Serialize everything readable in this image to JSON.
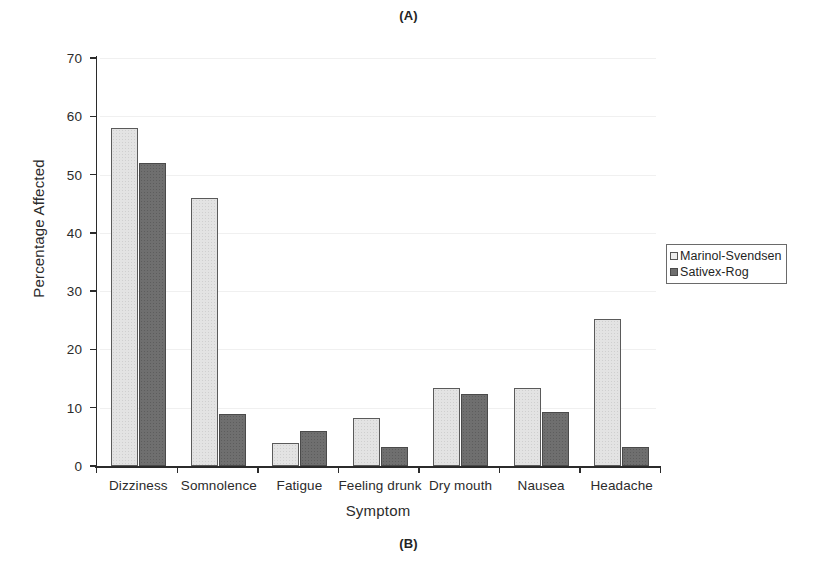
{
  "panels": {
    "top_label": "(A)",
    "bottom_label": "(B)"
  },
  "legend": {
    "position": "right",
    "entries": [
      {
        "label": "Marinol-Svendsen",
        "swatch": "light-gray-square-icon",
        "color": "#ededed"
      },
      {
        "label": "Sativex-Rog",
        "swatch": "dark-gray-square-icon",
        "color": "#6f6f6f"
      }
    ]
  },
  "chart_data": {
    "type": "bar",
    "title": "",
    "subtitle": "",
    "xlabel": "Symptom",
    "ylabel": "Percentage Affected",
    "ylim": [
      0,
      70
    ],
    "ytick_interval": 10,
    "yticks": [
      0,
      10,
      20,
      30,
      40,
      50,
      60,
      70
    ],
    "ytick_labels": [
      "0",
      "10",
      "20",
      "30",
      "40",
      "50",
      "60",
      "70"
    ],
    "grid": false,
    "legend_position": "right",
    "categories": [
      "Dizziness",
      "Somnolence",
      "Fatigue",
      "Feeling drunk",
      "Dry mouth",
      "Nausea",
      "Headache"
    ],
    "series": [
      {
        "name": "Marinol-Svendsen",
        "color": "#ededed",
        "values": [
          58,
          46,
          4,
          8.3,
          13.3,
          13.3,
          25.3
        ]
      },
      {
        "name": "Sativex-Rog",
        "color": "#6f6f6f",
        "values": [
          52,
          9,
          6,
          3.3,
          12.3,
          9.3,
          3.3
        ]
      }
    ],
    "annotations": []
  }
}
